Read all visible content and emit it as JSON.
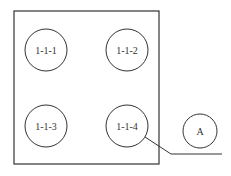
{
  "diagram": {
    "stroke_color": "#333333",
    "background": "#ffffff",
    "frame": {
      "x": 14,
      "y": 11,
      "width": 145,
      "height": 153
    },
    "nodes": [
      {
        "id": "1-1-1",
        "label": "1-1-1",
        "cx": 46,
        "cy": 50,
        "r": 21
      },
      {
        "id": "1-1-2",
        "label": "1-1-2",
        "cx": 127,
        "cy": 50,
        "r": 21
      },
      {
        "id": "1-1-3",
        "label": "1-1-3",
        "cx": 46,
        "cy": 126,
        "r": 21
      },
      {
        "id": "1-1-4",
        "label": "1-1-4",
        "cx": 127,
        "cy": 126,
        "r": 21
      }
    ],
    "callout": {
      "label": "A",
      "cx": 200,
      "cy": 131,
      "r": 17
    },
    "leader_line": {
      "points": "145,137 171,154 222,154"
    }
  }
}
